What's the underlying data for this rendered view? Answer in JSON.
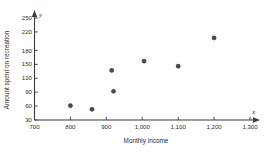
{
  "chart_data": {
    "type": "scatter",
    "title": "",
    "xlabel": "Monthly income",
    "ylabel": "Amount spent on recreation",
    "x_axis_variable": "x",
    "y_axis_variable": "y",
    "xlim": [
      700,
      1300
    ],
    "ylim": [
      30,
      250
    ],
    "grid": false,
    "legend": null,
    "x_ticks": [
      "700",
      "800",
      "900",
      "1,000",
      "1,100",
      "1,200",
      "1,300"
    ],
    "x_tick_values": [
      700,
      800,
      900,
      1000,
      1100,
      1200,
      1300
    ],
    "y_ticks": [
      "30",
      "60",
      "90",
      "120",
      "150",
      "180",
      "220",
      "250"
    ],
    "y_tick_values": [
      30,
      60,
      90,
      120,
      150,
      180,
      220,
      250
    ],
    "points": [
      {
        "x": 800,
        "y": 61
      },
      {
        "x": 860,
        "y": 53
      },
      {
        "x": 915,
        "y": 137
      },
      {
        "x": 920,
        "y": 92
      },
      {
        "x": 1005,
        "y": 157
      },
      {
        "x": 1100,
        "y": 146
      },
      {
        "x": 1200,
        "y": 207
      }
    ],
    "marker": "filled-circle",
    "marker_color": "#4a4a4a",
    "axis_color": "#3b3b3b"
  }
}
